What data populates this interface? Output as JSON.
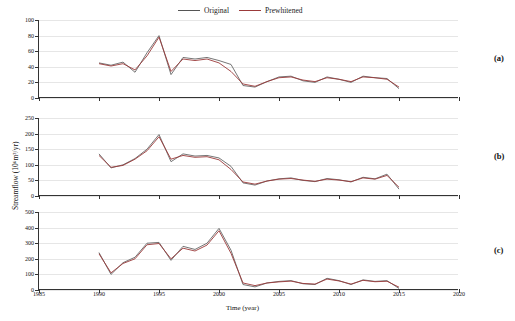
{
  "legend": {
    "items": [
      {
        "label": "Original",
        "color": "#666666"
      },
      {
        "label": "Prewhitened",
        "color": "#9b3a3a"
      }
    ]
  },
  "axes": {
    "ylabel": "Streamflow (10⁶m³/yr)",
    "xlabel": "Time (year)",
    "xticks": [
      "1985",
      "1990",
      "1995",
      "2000",
      "2005",
      "2010",
      "2015",
      "2020"
    ],
    "xlim": [
      1985,
      2020
    ]
  },
  "panels": [
    {
      "tag": "(a)",
      "yticks": [
        "0",
        "20",
        "40",
        "60",
        "80",
        "100"
      ],
      "ylim": [
        0,
        100
      ]
    },
    {
      "tag": "(b)",
      "yticks": [
        "0",
        "50",
        "100",
        "150",
        "200",
        "250"
      ],
      "ylim": [
        0,
        250
      ]
    },
    {
      "tag": "(c)",
      "yticks": [
        "0",
        "100",
        "200",
        "300",
        "400",
        "500"
      ],
      "ylim": [
        0,
        500
      ]
    }
  ],
  "chart_data": {
    "type": "line",
    "title": "",
    "xlabel": "Time (year)",
    "ylabel": "Streamflow (10⁶m³/yr)",
    "xlim": [
      1985,
      2020
    ],
    "grid": true,
    "legend_position": "top-center",
    "subplots": [
      {
        "tag": "(a)",
        "ylim": [
          0,
          100
        ],
        "yticks": [
          0,
          20,
          40,
          60,
          80,
          100
        ],
        "x": [
          1990,
          1991,
          1992,
          1993,
          1994,
          1995,
          1996,
          1997,
          1998,
          1999,
          2000,
          2001,
          2002,
          2003,
          2004,
          2005,
          2006,
          2007,
          2008,
          2009,
          2010,
          2011,
          2012,
          2013,
          2014,
          2015
        ],
        "series": [
          {
            "name": "Original",
            "color": "#666666",
            "values": [
              45,
              42,
              46,
              33,
              58,
              80,
              30,
              52,
              50,
              52,
              48,
              43,
              16,
              14,
              21,
              27,
              28,
              22,
              20,
              27,
              24,
              20,
              28,
              26,
              25,
              12
            ]
          },
          {
            "name": "Prewhitened",
            "color": "#9b3a3a",
            "values": [
              44,
              41,
              44,
              36,
              54,
              78,
              34,
              50,
              48,
              50,
              45,
              34,
              18,
              15,
              21,
              26,
              27,
              23,
              21,
              26,
              24,
              21,
              27,
              26,
              24,
              14
            ]
          }
        ]
      },
      {
        "tag": "(b)",
        "ylim": [
          0,
          250
        ],
        "yticks": [
          0,
          50,
          100,
          150,
          200,
          250
        ],
        "x": [
          1990,
          1991,
          1992,
          1993,
          1994,
          1995,
          1996,
          1997,
          1998,
          1999,
          2000,
          2001,
          2002,
          2003,
          2004,
          2005,
          2006,
          2007,
          2008,
          2009,
          2010,
          2011,
          2012,
          2013,
          2014,
          2015
        ],
        "series": [
          {
            "name": "Original",
            "color": "#666666",
            "values": [
              135,
              90,
              100,
              120,
              150,
              197,
              110,
              135,
              128,
              130,
              122,
              95,
              42,
              35,
              48,
              55,
              58,
              50,
              46,
              56,
              52,
              45,
              60,
              55,
              70,
              22
            ]
          },
          {
            "name": "Prewhitened",
            "color": "#9b3a3a",
            "values": [
              130,
              92,
              98,
              118,
              145,
              190,
              118,
              130,
              124,
              126,
              116,
              85,
              45,
              38,
              48,
              54,
              56,
              51,
              47,
              54,
              51,
              46,
              58,
              54,
              66,
              28
            ]
          }
        ]
      },
      {
        "tag": "(c)",
        "ylim": [
          0,
          500
        ],
        "yticks": [
          0,
          100,
          200,
          300,
          400,
          500
        ],
        "x": [
          1990,
          1991,
          1992,
          1993,
          1994,
          1995,
          1996,
          1997,
          1998,
          1999,
          2000,
          2001,
          2002,
          2003,
          2004,
          2005,
          2006,
          2007,
          2008,
          2009,
          2010,
          2011,
          2012,
          2013,
          2014,
          2015
        ],
        "series": [
          {
            "name": "Original",
            "color": "#666666",
            "values": [
              240,
              100,
              175,
              210,
              300,
              305,
              190,
              280,
              260,
              300,
              395,
              255,
              35,
              20,
              45,
              55,
              60,
              40,
              35,
              75,
              60,
              35,
              65,
              55,
              60,
              10
            ]
          },
          {
            "name": "Prewhitened",
            "color": "#9b3a3a",
            "values": [
              232,
              110,
              170,
              200,
              290,
              298,
              200,
              268,
              250,
              288,
              380,
              235,
              45,
              28,
              45,
              52,
              57,
              42,
              38,
              70,
              58,
              38,
              62,
              53,
              56,
              18
            ]
          }
        ]
      }
    ]
  }
}
